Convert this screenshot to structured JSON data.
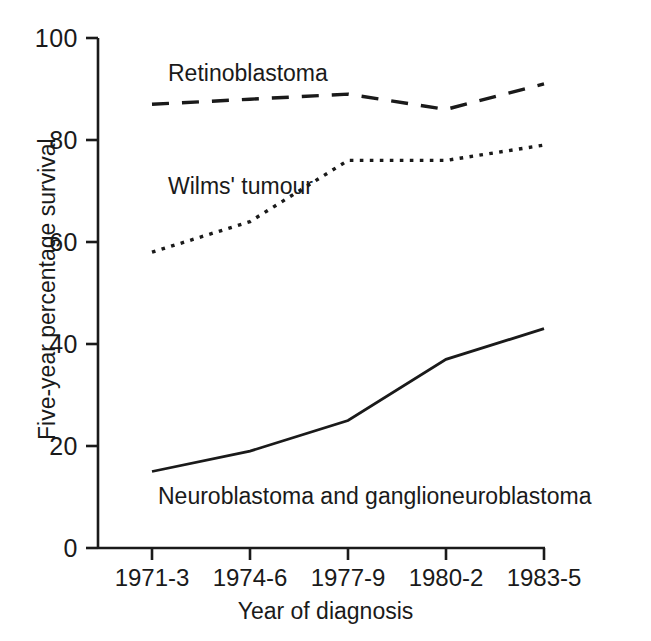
{
  "chart_data": {
    "type": "line",
    "title": "",
    "xlabel": "Year of diagnosis",
    "ylabel": "Five-year percentage survival",
    "categories": [
      "1971-3",
      "1974-6",
      "1977-9",
      "1980-2",
      "1983-5"
    ],
    "ylim": [
      0,
      100
    ],
    "yticks": [
      0,
      20,
      40,
      60,
      80,
      100
    ],
    "ytick_labels": [
      "0",
      "20",
      "40",
      "60",
      "80",
      "100"
    ],
    "grid": false,
    "legend_position": "inline-labels",
    "series": [
      {
        "name": "Retinoblastoma",
        "style": "dashed",
        "color": "#1a1a1a",
        "values": [
          87,
          88,
          89,
          86,
          91
        ]
      },
      {
        "name": "Wilms' tumour",
        "style": "dotted",
        "color": "#1a1a1a",
        "values": [
          58,
          64,
          76,
          76,
          79
        ]
      },
      {
        "name": "Neuroblastoma and ganglioneuroblastoma",
        "style": "solid",
        "color": "#1a1a1a",
        "values": [
          15,
          19,
          25,
          37,
          43
        ]
      }
    ],
    "annotations": [
      {
        "text": "Retinoblastoma",
        "x": 168,
        "y": 63
      },
      {
        "text": "Wilms' tumour",
        "x": 168,
        "y": 176
      },
      {
        "text": "Neuroblastoma and ganglioneuroblastoma",
        "x": 158,
        "y": 486
      }
    ]
  },
  "axis": {
    "y_tick_100": "100",
    "y_tick_80": "80",
    "y_tick_60": "60",
    "y_tick_40": "40",
    "y_tick_20": "20",
    "y_tick_0": "0",
    "x_tick_1": "1971-3",
    "x_tick_2": "1974-6",
    "x_tick_3": "1977-9",
    "x_tick_4": "1980-2",
    "x_tick_5": "1983-5",
    "x_title": "Year of diagnosis",
    "y_title": "Five-year percentage survival"
  },
  "labels": {
    "retinoblastoma": "Retinoblastoma",
    "wilms": "Wilms' tumour",
    "neuroblastoma": "Neuroblastoma and ganglioneuroblastoma"
  }
}
